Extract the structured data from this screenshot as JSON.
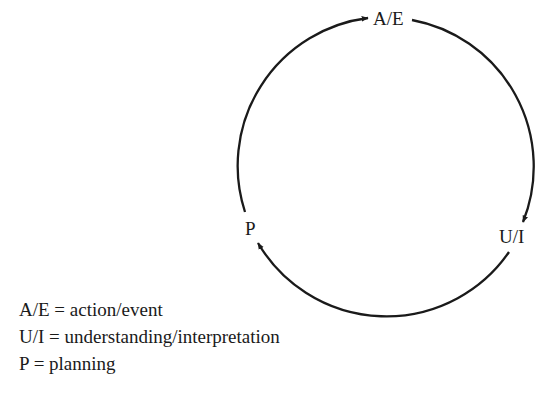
{
  "diagram": {
    "type": "cycle",
    "nodes": [
      {
        "id": "AE",
        "label": "A/E"
      },
      {
        "id": "UI",
        "label": "U/I"
      },
      {
        "id": "P",
        "label": "P"
      }
    ],
    "edges": [
      {
        "from": "AE",
        "to": "UI"
      },
      {
        "from": "UI",
        "to": "P"
      },
      {
        "from": "P",
        "to": "AE"
      }
    ],
    "stroke_color": "#1a1a1a"
  },
  "legend": [
    {
      "abbr": "A/E",
      "eq": "=",
      "meaning": "action/event"
    },
    {
      "abbr": "U/I",
      "eq": "=",
      "meaning": "understanding/interpretation"
    },
    {
      "abbr": "P",
      "eq": "=",
      "meaning": "planning"
    }
  ]
}
